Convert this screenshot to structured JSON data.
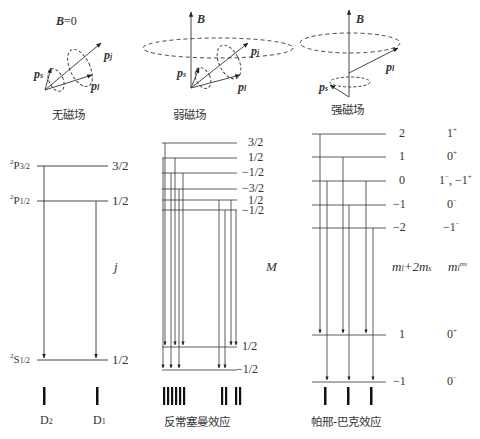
{
  "panels": {
    "no_field": {
      "title": "无磁场",
      "field_label": "B=0",
      "vectors": [
        "p_j",
        "p_s",
        "p_l"
      ],
      "levels": [
        {
          "term": "²P₃/₂",
          "j": "3/2"
        },
        {
          "term": "²P₁/₂",
          "j": "1/2"
        },
        {
          "term": "²S₁/₂",
          "j": "1/2"
        }
      ],
      "axis_label": "j",
      "lines": [
        "D₂",
        "D₁"
      ],
      "line_labels": {
        "d2": "D",
        "d2_sub": "2",
        "d1": "D",
        "d1_sub": "1"
      }
    },
    "weak_field": {
      "title": "弱磁场",
      "field_label": "B",
      "vectors": [
        "p_j",
        "p_s",
        "p_l"
      ],
      "m_values_upper": [
        "3/2",
        "1/2",
        "−1/2",
        "−3/2",
        "1/2",
        "−1/2"
      ],
      "m_values_lower": [
        "1/2",
        "−1/2"
      ],
      "axis_label": "M",
      "effect_name": "反常塞曼效应",
      "spectral_groups": {
        "left_count": 6,
        "right_count": 4
      }
    },
    "strong_field": {
      "title": "强磁场",
      "field_label": "B",
      "vectors": [
        "p_l",
        "p_s"
      ],
      "levels_upper": [
        {
          "ml2ms": "2",
          "ml_ms": "1⁺"
        },
        {
          "ml2ms": "1",
          "ml_ms": "0⁺"
        },
        {
          "ml2ms": "0",
          "ml_ms": "1⁻, −1⁺"
        },
        {
          "ml2ms": "−1",
          "ml_ms": "0⁻"
        },
        {
          "ml2ms": "−2",
          "ml_ms": "−1⁻"
        }
      ],
      "levels_lower": [
        {
          "ml2ms": "1",
          "ml_ms": "0⁺"
        },
        {
          "ml2ms": "−1",
          "ml_ms": "0⁻"
        }
      ],
      "axis_label_1": "m",
      "axis_label_1_rest": "+2m",
      "axis_label_2": "m",
      "effect_name": "帕邢-巴克效应",
      "spectral_lines": 3
    }
  },
  "labels": {
    "B0": "B",
    "B0_eq": "=0",
    "B": "B",
    "p": "p",
    "sub_j": "j",
    "sub_s": "s",
    "sub_l": "l",
    "P": "P",
    "S": "S",
    "sup2": "2",
    "sub32": "3/2",
    "sub12": "1/2",
    "j32": "3/2",
    "j12a": "1/2",
    "j12b": "1/2",
    "j": "j",
    "M": "M",
    "w1": "3/2",
    "w2": "1/2",
    "w3": "−1/2",
    "w4": "−3/2",
    "w5": "1/2",
    "w6": "−1/2",
    "w7": "1/2",
    "w8": "−1/2",
    "s1": "2",
    "s2": "1",
    "s3": "0",
    "s4": "−1",
    "s5": "−2",
    "s6": "1",
    "s7": "−1",
    "t1": "1",
    "t1s": "+",
    "t2": "0",
    "t2s": "+",
    "t3a": "1",
    "t3as": "−",
    "t3b": ", −1",
    "t3bs": "+",
    "t4": "0",
    "t4s": "−",
    "t5": "−1",
    "t5s": "−",
    "t6": "0",
    "t6s": "+",
    "t7": "0",
    "t7s": "−",
    "ml": "m",
    "ml_sub": "l",
    "plus2ms": "+2m",
    "ms_sub": "s",
    "mlms": "m",
    "mlms_sub": "l",
    "mlms_sup": "m",
    "mlms_supsub": "s"
  }
}
